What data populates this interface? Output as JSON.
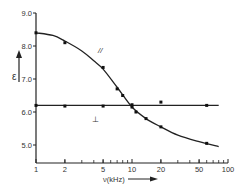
{
  "chart_data": {
    "type": "line",
    "title": "",
    "xlabel": "ν(kHz)",
    "ylabel": "ε",
    "xscale": "log",
    "xlim": [
      1,
      100
    ],
    "ylim": [
      4.8,
      9.0
    ],
    "x_ticks": [
      1,
      2,
      5,
      10,
      20,
      50,
      100
    ],
    "x_tick_labels": [
      "1",
      "2",
      "5",
      "10",
      "20",
      "50",
      "100"
    ],
    "y_ticks": [
      5.0,
      6.0,
      7.0,
      8.0,
      9.0
    ],
    "y_tick_labels": [
      "5.0",
      "6.0",
      "7.0",
      "8.0",
      "9.0"
    ],
    "grid": false,
    "series": [
      {
        "name": "∥",
        "label": "//",
        "points": [
          {
            "x": 1,
            "y": 8.4
          },
          {
            "x": 2,
            "y": 8.1
          },
          {
            "x": 5,
            "y": 7.35
          },
          {
            "x": 7,
            "y": 6.7
          },
          {
            "x": 8,
            "y": 6.5
          },
          {
            "x": 10,
            "y": 6.15
          },
          {
            "x": 11,
            "y": 6.0
          },
          {
            "x": 14,
            "y": 5.8
          },
          {
            "x": 20,
            "y": 5.55
          },
          {
            "x": 60,
            "y": 5.05
          }
        ],
        "fit_curve": [
          {
            "x": 1,
            "y": 8.4
          },
          {
            "x": 1.5,
            "y": 8.32
          },
          {
            "x": 2,
            "y": 8.15
          },
          {
            "x": 3,
            "y": 7.85
          },
          {
            "x": 4,
            "y": 7.55
          },
          {
            "x": 5,
            "y": 7.3
          },
          {
            "x": 7,
            "y": 6.75
          },
          {
            "x": 10,
            "y": 6.15
          },
          {
            "x": 14,
            "y": 5.8
          },
          {
            "x": 20,
            "y": 5.55
          },
          {
            "x": 30,
            "y": 5.3
          },
          {
            "x": 50,
            "y": 5.1
          },
          {
            "x": 80,
            "y": 4.95
          }
        ]
      },
      {
        "name": "⊥",
        "label": "⊥",
        "points": [
          {
            "x": 1,
            "y": 6.2
          },
          {
            "x": 2,
            "y": 6.18
          },
          {
            "x": 5,
            "y": 6.18
          },
          {
            "x": 10,
            "y": 6.22
          },
          {
            "x": 20,
            "y": 6.3
          },
          {
            "x": 60,
            "y": 6.2
          }
        ],
        "fit_line": {
          "x_from": 1,
          "x_to": 80,
          "y": 6.2
        }
      }
    ],
    "annotations": [
      {
        "text": "//",
        "x": 7.5,
        "y": 7.5
      },
      {
        "text": "⊥",
        "x": 4,
        "y": 5.85
      }
    ]
  },
  "labels": {
    "y_axis_symbol": "ε",
    "x_axis_label": "ν(kHz)",
    "parallel_label": "//",
    "perp_label": "⊥"
  }
}
